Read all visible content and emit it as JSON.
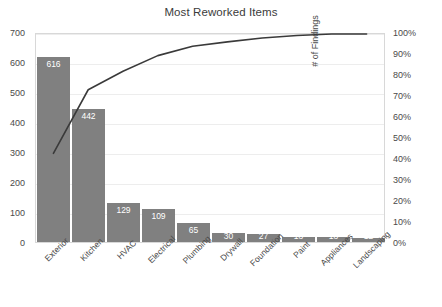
{
  "chart_data": {
    "type": "bar",
    "title": "Most Reworked Items",
    "xlabel": "",
    "ylabel": "",
    "y2label": "# of Findings",
    "categories": [
      "Exterior",
      "Kitchen",
      "HVAC",
      "Electrical",
      "Plumbing",
      "Drywall",
      "Foundation",
      "Paint",
      "Appliances",
      "Landscaping"
    ],
    "values": [
      616,
      442,
      129,
      109,
      65,
      30,
      27,
      18,
      18,
      12
    ],
    "value_labels": [
      "616",
      "442",
      "129",
      "109",
      "65",
      "30",
      "27",
      "18",
      "18",
      "12"
    ],
    "series": [
      {
        "name": "# of Findings",
        "type": "bar",
        "values": [
          616,
          442,
          129,
          109,
          65,
          30,
          27,
          18,
          18,
          12
        ]
      },
      {
        "name": "Cumulative %",
        "type": "line",
        "values": [
          42.6,
          73.2,
          82.1,
          89.6,
          94.1,
          96.2,
          98.1,
          99.3,
          100.0,
          100.0
        ]
      }
    ],
    "ylim": [
      0,
      700
    ],
    "y2lim": [
      0,
      100
    ],
    "yticks": [
      "0",
      "100",
      "200",
      "300",
      "400",
      "500",
      "600",
      "700"
    ],
    "y2ticks": [
      "0%",
      "10%",
      "20%",
      "30%",
      "40%",
      "50%",
      "60%",
      "70%",
      "80%",
      "90%",
      "100%"
    ],
    "grid": true,
    "legend": "none",
    "total": 1446,
    "colors": {
      "bar": "#808080",
      "line": "#3a3a3a",
      "grid": "#ededed",
      "border": "#d8d8d8",
      "text": "#4a4a4a",
      "bar_label": "#ffffff",
      "background": "#ffffff"
    }
  }
}
